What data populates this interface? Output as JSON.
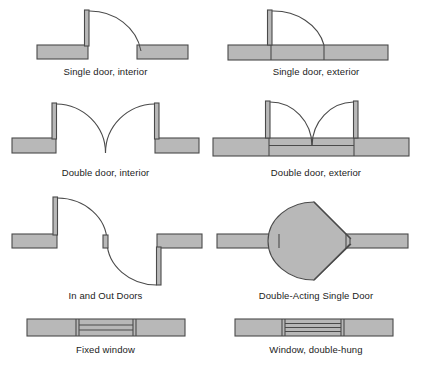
{
  "sheet": {
    "title": "Architectural door and window plan symbols",
    "background_color": "#ffffff",
    "fill_color": "#b8b8b8",
    "stroke_color": "#4a4a4a",
    "label_color": "#1b1b1b"
  },
  "symbols": [
    {
      "id": "single-door-interior",
      "label": "Single door, interior",
      "type": "door",
      "swing": "single",
      "wall": "interior"
    },
    {
      "id": "single-door-exterior",
      "label": "Single door, exterior",
      "type": "door",
      "swing": "single",
      "wall": "exterior"
    },
    {
      "id": "double-door-interior",
      "label": "Double door, interior",
      "type": "door",
      "swing": "double",
      "wall": "interior"
    },
    {
      "id": "double-door-exterior",
      "label": "Double door, exterior",
      "type": "door",
      "swing": "double",
      "wall": "exterior"
    },
    {
      "id": "in-and-out-doors",
      "label": "In and Out Doors",
      "type": "door",
      "swing": "in-and-out",
      "wall": "interior"
    },
    {
      "id": "double-acting-single-door",
      "label": "Double-Acting Single Door",
      "type": "door",
      "swing": "double-acting",
      "wall": "interior"
    },
    {
      "id": "fixed-window",
      "label": "Fixed window",
      "type": "window",
      "sashes": 2
    },
    {
      "id": "window-double-hung",
      "label": "Window, double-hung",
      "type": "window",
      "sashes": 3
    }
  ]
}
